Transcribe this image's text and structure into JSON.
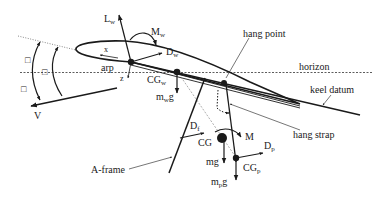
{
  "diagram": {
    "type": "free-body diagram",
    "labels": {
      "lift_wing": "L",
      "lift_wing_sub": "w",
      "moment_wing": "M",
      "moment_wing_sub": "w",
      "drag_wing": "D",
      "drag_wing_sub": "w",
      "x_axis": "x",
      "z_axis": "z",
      "arp": "arp",
      "cg_wing": "CG",
      "cg_wing_sub": "w",
      "weight_wing_m": "m",
      "weight_wing_sub": "w",
      "weight_wing_g": "g",
      "hang_point": "hang point",
      "horizon": "horizon",
      "keel_datum": "keel datum",
      "velocity": "V",
      "drag_frame": "D",
      "drag_frame_sub": "f",
      "cg": "CG",
      "moment": "M",
      "drag_pilot": "D",
      "drag_pilot_sub": "p",
      "weight": "mg",
      "cg_pilot": "CG",
      "cg_pilot_sub": "p",
      "weight_pilot_m": "m",
      "weight_pilot_sub": "p",
      "weight_pilot_g": "g",
      "hang_strap": "hang strap",
      "a_frame": "A-frame"
    },
    "angle_symbols": [
      "□",
      "□",
      "□"
    ],
    "colors": {
      "ink": "#1a1a1a",
      "guide": "#555555",
      "background": "#ffffff"
    }
  }
}
